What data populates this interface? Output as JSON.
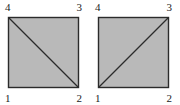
{
  "figure": {
    "background_color": "#ffffff",
    "fill_color": "#b9b9b9",
    "stroke_color": "#2b2b2b",
    "label_color": "#1c1c1c"
  },
  "shapes": [
    {
      "id": "quad-left",
      "name": "quadrilateral-left",
      "diagonal": "top-left-to-bottom-right",
      "diagonal_from_node": "4",
      "diagonal_to_node": "2",
      "nodes": {
        "top_left": "4",
        "top_right": "3",
        "bottom_left": "1",
        "bottom_right": "2"
      }
    },
    {
      "id": "quad-right",
      "name": "quadrilateral-right",
      "diagonal": "bottom-left-to-top-right",
      "diagonal_from_node": "1",
      "diagonal_to_node": "3",
      "nodes": {
        "top_left": "4",
        "top_right": "3",
        "bottom_left": "1",
        "bottom_right": "2"
      }
    }
  ]
}
